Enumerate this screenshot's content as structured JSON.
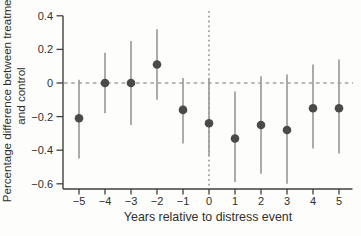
{
  "chart_data": {
    "type": "scatter",
    "subtype": "point-estimates-with-confidence-intervals",
    "title": "",
    "xlabel": "Years relative to distress event",
    "ylabel": "Percentage difference between treatment and control",
    "ylabel_lines": [
      "Percentage difference between treatment",
      "and control"
    ],
    "x": [
      -5,
      -4,
      -3,
      -2,
      -1,
      0,
      1,
      2,
      3,
      4,
      5
    ],
    "series": [
      {
        "name": "estimate",
        "values": [
          -0.21,
          0.0,
          0.0,
          0.11,
          -0.16,
          -0.24,
          -0.33,
          -0.25,
          -0.28,
          -0.15,
          -0.15
        ]
      }
    ],
    "ci_low": [
      -0.45,
      -0.18,
      -0.25,
      -0.1,
      -0.36,
      -0.43,
      -0.59,
      -0.54,
      -0.6,
      -0.39,
      -0.42
    ],
    "ci_high": [
      0.02,
      0.18,
      0.25,
      0.32,
      0.03,
      0.03,
      -0.05,
      0.04,
      0.05,
      0.11,
      0.14
    ],
    "xticks": [
      -5,
      -4,
      -3,
      -2,
      -1,
      0,
      1,
      2,
      3,
      4,
      5
    ],
    "xtick_labels": [
      "−5",
      "−4",
      "−3",
      "−2",
      "−1",
      "0",
      "1",
      "2",
      "3",
      "4",
      "5"
    ],
    "yticks": [
      0.4,
      0.2,
      0,
      -0.2,
      -0.4,
      -0.6
    ],
    "ytick_labels": [
      "0.4",
      "0.2",
      "0",
      "−0.2",
      "−0.4",
      "−0.6"
    ],
    "ylim": [
      -0.6,
      0.4
    ],
    "xlim": [
      -5.6,
      5.5
    ],
    "grid": false,
    "legend": null,
    "reference_lines": [
      {
        "axis": "y",
        "value": 0,
        "style": "dashed"
      },
      {
        "axis": "x",
        "value": 0,
        "style": "dashed"
      }
    ],
    "colors": {
      "point": "#4a4a48",
      "whisker": "#9d9d9b",
      "axis": "#3f3f3d",
      "dashed": "#767674",
      "text": "#2f2f2d",
      "background": "#fdfdfc"
    }
  }
}
